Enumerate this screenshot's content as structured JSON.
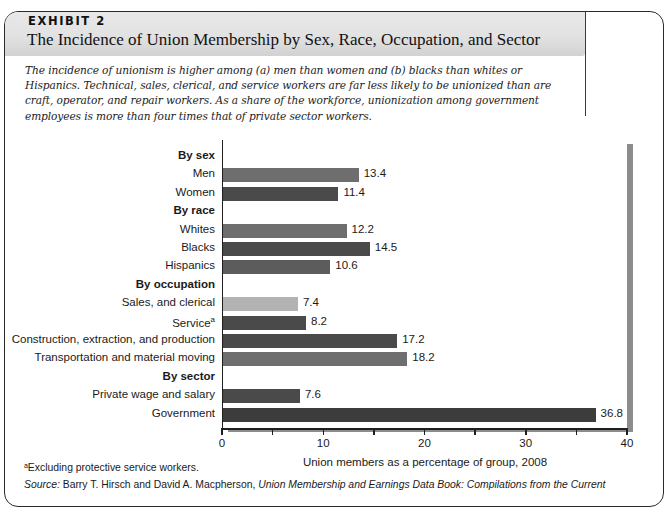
{
  "exhibit": {
    "label": "EXHIBIT 2",
    "title": "The Incidence of Union Membership by Sex, Race, Occupation, and Sector",
    "intro": "The incidence of unionism is higher among (a) men than women and (b) blacks than whites or Hispanics. Technical, sales, clerical, and service workers are far less likely to be unionized than are craft, operator, and repair workers. As a share of the workforce, unionization among government employees is more than four times that of private sector workers."
  },
  "footnotes": {
    "marker_note": "ᵃExcluding protective service workers.",
    "source_lead": "Source:",
    "source_authors": " Barry T. Hirsch and David A. Macpherson, ",
    "source_title": "Union Membership and Earnings Data Book: Compilations from the Current"
  },
  "chart_data": {
    "type": "bar",
    "orientation": "horizontal",
    "title": "",
    "xlabel": "Union members as a percentage of group, 2008",
    "ylabel": "",
    "xlim": [
      0,
      40
    ],
    "xticks": [
      0,
      5,
      10,
      15,
      20,
      25,
      30,
      35,
      40
    ],
    "xtick_labels": [
      "0",
      "",
      "10",
      "",
      "20",
      "",
      "30",
      "",
      "40"
    ],
    "grid": false,
    "legend": "none",
    "rows": [
      {
        "label": "By sex",
        "kind": "group",
        "value": null,
        "value_text": "",
        "color": ""
      },
      {
        "label": "Men",
        "kind": "bar",
        "value": 13.4,
        "value_text": "13.4",
        "color": "#6e6e6e"
      },
      {
        "label": "Women",
        "kind": "bar",
        "value": 11.4,
        "value_text": "11.4",
        "color": "#4a4a4a"
      },
      {
        "label": "By race",
        "kind": "group",
        "value": null,
        "value_text": "",
        "color": ""
      },
      {
        "label": "Whites",
        "kind": "bar",
        "value": 12.2,
        "value_text": "12.2",
        "color": "#6e6e6e"
      },
      {
        "label": "Blacks",
        "kind": "bar",
        "value": 14.5,
        "value_text": "14.5",
        "color": "#4a4a4a"
      },
      {
        "label": "Hispanics",
        "kind": "bar",
        "value": 10.6,
        "value_text": "10.6",
        "color": "#5c5c5c"
      },
      {
        "label": "By occupation",
        "kind": "group",
        "value": null,
        "value_text": "",
        "color": ""
      },
      {
        "label": "Sales, and clerical",
        "kind": "bar",
        "value": 7.4,
        "value_text": "7.4",
        "color": "#b3b3b3"
      },
      {
        "label": "Service",
        "kind": "bar",
        "value": 8.2,
        "value_text": "8.2",
        "color": "#4a4a4a",
        "superscript": "a"
      },
      {
        "label": "Construction, extraction, and production",
        "kind": "bar",
        "value": 17.2,
        "value_text": "17.2",
        "color": "#4a4a4a"
      },
      {
        "label": "Transportation and material moving",
        "kind": "bar",
        "value": 18.2,
        "value_text": "18.2",
        "color": "#6e6e6e"
      },
      {
        "label": "By sector",
        "kind": "group",
        "value": null,
        "value_text": "",
        "color": ""
      },
      {
        "label": "Private wage and salary",
        "kind": "bar",
        "value": 7.6,
        "value_text": "7.6",
        "color": "#4a4a4a"
      },
      {
        "label": "Government",
        "kind": "bar",
        "value": 36.8,
        "value_text": "36.8",
        "color": "#3c3c3c"
      }
    ]
  }
}
